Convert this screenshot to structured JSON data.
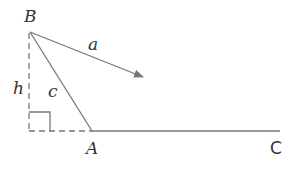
{
  "diagram": {
    "labels": {
      "B": "B",
      "a": "a",
      "h": "h",
      "c": "c",
      "A": "A",
      "C": "C"
    },
    "colors": {
      "line": "#777777",
      "text": "#333333"
    }
  }
}
